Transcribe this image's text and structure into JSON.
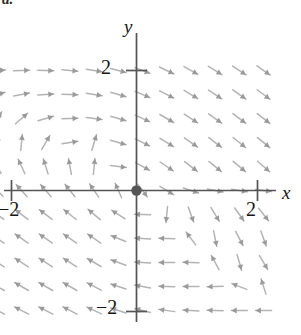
{
  "figure": {
    "caption": "a.",
    "background_color": "#ffffff"
  },
  "axes": {
    "x_label": "x",
    "y_label": "y",
    "axis_color": "#555555",
    "origin_dot_color": "#555555",
    "ticks": {
      "x_positive": "2",
      "x_negative": "−2",
      "y_positive": "2",
      "y_negative": "−2"
    }
  },
  "chart_data": {
    "type": "scatter",
    "subtype": "vector-field",
    "title": "",
    "xlabel": "x",
    "ylabel": "y",
    "xlim": [
      -2.6,
      2.6
    ],
    "ylim": [
      -2.6,
      2.6
    ],
    "xticks": [
      -2,
      2
    ],
    "yticks": [
      -2,
      2
    ],
    "xticklabels": [
      "−2",
      "2"
    ],
    "yticklabels": [
      "−2",
      "2"
    ],
    "grid": false,
    "legend": null,
    "arrow_color": "#b3b3b3",
    "arrowhead_color": "#9a9a9a",
    "grid_spacing": 0.4,
    "arrow_length_px": 16,
    "spiral_center": [
      1.0,
      -0.8
    ],
    "vectors": [
      {
        "x": -2.3,
        "y": 2.0,
        "u": 1.0,
        "v": 0.06
      },
      {
        "x": -1.9,
        "y": 2.0,
        "u": 1.0,
        "v": 0.02
      },
      {
        "x": -1.5,
        "y": 2.0,
        "u": 1.0,
        "v": -0.02
      },
      {
        "x": -1.1,
        "y": 2.0,
        "u": 1.0,
        "v": -0.08
      },
      {
        "x": -0.7,
        "y": 2.0,
        "u": 1.0,
        "v": -0.16
      },
      {
        "x": -0.3,
        "y": 2.0,
        "u": 1.0,
        "v": -0.26
      },
      {
        "x": 0.1,
        "y": 2.0,
        "u": 1.0,
        "v": -0.38
      },
      {
        "x": 0.5,
        "y": 2.0,
        "u": 1.0,
        "v": -0.48
      },
      {
        "x": 0.9,
        "y": 2.0,
        "u": 1.0,
        "v": -0.56
      },
      {
        "x": 1.3,
        "y": 2.0,
        "u": 1.0,
        "v": -0.62
      },
      {
        "x": 1.7,
        "y": 2.0,
        "u": 1.0,
        "v": -0.66
      },
      {
        "x": 2.1,
        "y": 2.0,
        "u": 1.0,
        "v": -0.7
      },
      {
        "x": -2.3,
        "y": 1.6,
        "u": 1.0,
        "v": 0.3
      },
      {
        "x": -1.9,
        "y": 1.6,
        "u": 1.0,
        "v": 0.18
      },
      {
        "x": -1.5,
        "y": 1.6,
        "u": 1.0,
        "v": 0.06
      },
      {
        "x": -1.1,
        "y": 1.6,
        "u": 1.0,
        "v": -0.04
      },
      {
        "x": -0.7,
        "y": 1.6,
        "u": 1.0,
        "v": -0.16
      },
      {
        "x": -0.3,
        "y": 1.6,
        "u": 1.0,
        "v": -0.3
      },
      {
        "x": 0.1,
        "y": 1.6,
        "u": 1.0,
        "v": -0.42
      },
      {
        "x": 0.5,
        "y": 1.6,
        "u": 1.0,
        "v": -0.52
      },
      {
        "x": 0.9,
        "y": 1.6,
        "u": 1.0,
        "v": -0.6
      },
      {
        "x": 1.3,
        "y": 1.6,
        "u": 1.0,
        "v": -0.66
      },
      {
        "x": 1.7,
        "y": 1.6,
        "u": 1.0,
        "v": -0.7
      },
      {
        "x": 2.1,
        "y": 1.6,
        "u": 1.0,
        "v": -0.74
      },
      {
        "x": -2.3,
        "y": 1.2,
        "u": 0.55,
        "v": 0.84
      },
      {
        "x": -1.9,
        "y": 1.2,
        "u": 0.75,
        "v": 0.66
      },
      {
        "x": -1.5,
        "y": 1.2,
        "u": 1.0,
        "v": 0.28
      },
      {
        "x": -1.1,
        "y": 1.2,
        "u": 1.0,
        "v": 0.04
      },
      {
        "x": -0.7,
        "y": 1.2,
        "u": 1.0,
        "v": -0.12
      },
      {
        "x": -0.3,
        "y": 1.2,
        "u": 1.0,
        "v": -0.3
      },
      {
        "x": 0.1,
        "y": 1.2,
        "u": 1.0,
        "v": -0.46
      },
      {
        "x": 0.5,
        "y": 1.2,
        "u": 1.0,
        "v": -0.58
      },
      {
        "x": 0.9,
        "y": 1.2,
        "u": 1.0,
        "v": -0.66
      },
      {
        "x": 1.3,
        "y": 1.2,
        "u": 1.0,
        "v": -0.72
      },
      {
        "x": 1.7,
        "y": 1.2,
        "u": 1.0,
        "v": -0.76
      },
      {
        "x": 2.1,
        "y": 1.2,
        "u": 1.0,
        "v": -0.78
      },
      {
        "x": -2.3,
        "y": 0.8,
        "u": 0.18,
        "v": 1.0
      },
      {
        "x": -1.9,
        "y": 0.8,
        "u": 0.1,
        "v": 1.0
      },
      {
        "x": -1.5,
        "y": 0.8,
        "u": 0.52,
        "v": 0.88
      },
      {
        "x": -1.1,
        "y": 0.8,
        "u": 1.0,
        "v": 0.16
      },
      {
        "x": -0.7,
        "y": 0.8,
        "u": 0.3,
        "v": 1.0
      },
      {
        "x": -0.3,
        "y": 0.8,
        "u": 1.0,
        "v": -0.28
      },
      {
        "x": 0.1,
        "y": 0.8,
        "u": 1.0,
        "v": -0.5
      },
      {
        "x": 0.5,
        "y": 0.8,
        "u": 1.0,
        "v": -0.62
      },
      {
        "x": 0.9,
        "y": 0.8,
        "u": 1.0,
        "v": -0.7
      },
      {
        "x": 1.3,
        "y": 0.8,
        "u": 1.0,
        "v": -0.76
      },
      {
        "x": 1.7,
        "y": 0.8,
        "u": 1.0,
        "v": -0.8
      },
      {
        "x": 2.1,
        "y": 0.8,
        "u": 1.0,
        "v": -0.82
      },
      {
        "x": -2.3,
        "y": 0.4,
        "u": -0.48,
        "v": 0.88
      },
      {
        "x": -1.9,
        "y": 0.4,
        "u": -0.42,
        "v": 0.9
      },
      {
        "x": -1.5,
        "y": 0.4,
        "u": -0.3,
        "v": 0.95
      },
      {
        "x": -1.1,
        "y": 0.4,
        "u": -0.18,
        "v": 0.98
      },
      {
        "x": -0.7,
        "y": 0.4,
        "u": 0.1,
        "v": 1.0
      },
      {
        "x": -0.3,
        "y": 0.4,
        "u": 1.0,
        "v": -0.12
      },
      {
        "x": 0.1,
        "y": 0.4,
        "u": 1.0,
        "v": -0.55
      },
      {
        "x": 0.5,
        "y": 0.4,
        "u": 1.0,
        "v": -0.68
      },
      {
        "x": 0.9,
        "y": 0.4,
        "u": 1.0,
        "v": -0.76
      },
      {
        "x": 1.3,
        "y": 0.4,
        "u": 1.0,
        "v": -0.82
      },
      {
        "x": 1.7,
        "y": 0.4,
        "u": 1.0,
        "v": -0.84
      },
      {
        "x": 2.1,
        "y": 0.4,
        "u": 1.0,
        "v": -0.86
      },
      {
        "x": -2.3,
        "y": 0.0,
        "u": -0.7,
        "v": 0.72
      },
      {
        "x": -1.9,
        "y": 0.0,
        "u": -0.68,
        "v": 0.74
      },
      {
        "x": -1.5,
        "y": 0.0,
        "u": -0.66,
        "v": 0.76
      },
      {
        "x": -1.1,
        "y": 0.0,
        "u": -0.62,
        "v": 0.78
      },
      {
        "x": -0.7,
        "y": 0.0,
        "u": -0.56,
        "v": 0.82
      },
      {
        "x": -0.3,
        "y": 0.0,
        "u": -0.4,
        "v": 0.9
      },
      {
        "x": 0.1,
        "y": 0.0,
        "u": 0.6,
        "v": -0.8
      },
      {
        "x": 0.5,
        "y": 0.0,
        "u": 0.85,
        "v": -0.52
      },
      {
        "x": 0.9,
        "y": 0.0,
        "u": 0.95,
        "v": -0.32
      },
      {
        "x": 1.3,
        "y": 0.0,
        "u": 1.0,
        "v": -0.2
      },
      {
        "x": 1.7,
        "y": 0.0,
        "u": 1.0,
        "v": -0.16
      },
      {
        "x": 2.1,
        "y": 0.0,
        "u": 1.0,
        "v": -0.14
      },
      {
        "x": -2.3,
        "y": -0.4,
        "u": -0.8,
        "v": 0.6
      },
      {
        "x": -1.9,
        "y": -0.4,
        "u": -0.8,
        "v": 0.6
      },
      {
        "x": -1.5,
        "y": -0.4,
        "u": -0.8,
        "v": 0.6
      },
      {
        "x": -1.1,
        "y": -0.4,
        "u": -0.78,
        "v": 0.62
      },
      {
        "x": -0.7,
        "y": -0.4,
        "u": -0.76,
        "v": 0.64
      },
      {
        "x": -0.3,
        "y": -0.4,
        "u": -0.84,
        "v": 0.54
      },
      {
        "x": 0.1,
        "y": -0.4,
        "u": -1.0,
        "v": 0.04
      },
      {
        "x": 0.5,
        "y": -0.4,
        "u": -0.1,
        "v": -1.0
      },
      {
        "x": 0.9,
        "y": -0.4,
        "u": 0.34,
        "v": -0.94
      },
      {
        "x": 1.3,
        "y": -0.4,
        "u": 0.52,
        "v": -0.86
      },
      {
        "x": 1.7,
        "y": -0.4,
        "u": 0.58,
        "v": -0.82
      },
      {
        "x": 2.1,
        "y": -0.4,
        "u": 0.62,
        "v": -0.78
      },
      {
        "x": -2.3,
        "y": -0.8,
        "u": -0.82,
        "v": 0.56
      },
      {
        "x": -1.9,
        "y": -0.8,
        "u": -0.82,
        "v": 0.56
      },
      {
        "x": -1.5,
        "y": -0.8,
        "u": -0.82,
        "v": 0.56
      },
      {
        "x": -1.1,
        "y": -0.8,
        "u": -0.82,
        "v": 0.56
      },
      {
        "x": -0.7,
        "y": -0.8,
        "u": -0.82,
        "v": 0.56
      },
      {
        "x": -0.3,
        "y": -0.8,
        "u": -0.92,
        "v": 0.38
      },
      {
        "x": 0.1,
        "y": -0.8,
        "u": -1.0,
        "v": 0.06
      },
      {
        "x": 0.5,
        "y": -0.8,
        "u": -1.0,
        "v": 0.02
      },
      {
        "x": 0.9,
        "y": -0.8,
        "u": -0.6,
        "v": 0.8
      },
      {
        "x": 1.3,
        "y": -0.8,
        "u": 0.2,
        "v": -0.98
      },
      {
        "x": 1.7,
        "y": -0.8,
        "u": 0.46,
        "v": -0.88
      },
      {
        "x": 2.1,
        "y": -0.8,
        "u": 0.34,
        "v": -0.94
      },
      {
        "x": -2.3,
        "y": -1.2,
        "u": -0.84,
        "v": 0.54
      },
      {
        "x": -1.9,
        "y": -1.2,
        "u": -0.84,
        "v": 0.54
      },
      {
        "x": -1.5,
        "y": -1.2,
        "u": -0.84,
        "v": 0.54
      },
      {
        "x": -1.1,
        "y": -1.2,
        "u": -0.84,
        "v": 0.54
      },
      {
        "x": -0.7,
        "y": -1.2,
        "u": -0.86,
        "v": 0.5
      },
      {
        "x": -0.3,
        "y": -1.2,
        "u": -0.94,
        "v": 0.34
      },
      {
        "x": 0.1,
        "y": -1.2,
        "u": -1.0,
        "v": 0.06
      },
      {
        "x": 0.5,
        "y": -1.2,
        "u": -1.0,
        "v": 0.0
      },
      {
        "x": 0.9,
        "y": -1.2,
        "u": -1.0,
        "v": 0.02
      },
      {
        "x": 1.3,
        "y": -1.2,
        "u": -0.48,
        "v": 0.88
      },
      {
        "x": 1.7,
        "y": -1.2,
        "u": 0.28,
        "v": -0.96
      },
      {
        "x": 2.1,
        "y": -1.2,
        "u": 0.52,
        "v": -0.86
      },
      {
        "x": -2.3,
        "y": -1.6,
        "u": -0.86,
        "v": 0.5
      },
      {
        "x": -1.9,
        "y": -1.6,
        "u": -0.86,
        "v": 0.5
      },
      {
        "x": -1.5,
        "y": -1.6,
        "u": -0.86,
        "v": 0.5
      },
      {
        "x": -1.1,
        "y": -1.6,
        "u": -0.86,
        "v": 0.5
      },
      {
        "x": -0.7,
        "y": -1.6,
        "u": -0.88,
        "v": 0.46
      },
      {
        "x": -0.3,
        "y": -1.6,
        "u": -0.94,
        "v": 0.32
      },
      {
        "x": 0.1,
        "y": -1.6,
        "u": -0.98,
        "v": 0.18
      },
      {
        "x": 0.5,
        "y": -1.6,
        "u": -1.0,
        "v": 0.04
      },
      {
        "x": 0.9,
        "y": -1.6,
        "u": -1.0,
        "v": 0.0
      },
      {
        "x": 1.3,
        "y": -1.6,
        "u": -1.0,
        "v": -0.02
      },
      {
        "x": 1.7,
        "y": -1.6,
        "u": -0.92,
        "v": 0.36
      },
      {
        "x": 2.1,
        "y": -1.6,
        "u": -0.3,
        "v": 0.94
      },
      {
        "x": -2.3,
        "y": -2.0,
        "u": -0.88,
        "v": 0.46
      },
      {
        "x": -1.9,
        "y": -2.0,
        "u": -0.88,
        "v": 0.46
      },
      {
        "x": -1.5,
        "y": -2.0,
        "u": -0.88,
        "v": 0.46
      },
      {
        "x": -1.1,
        "y": -2.0,
        "u": -0.88,
        "v": 0.46
      },
      {
        "x": -0.7,
        "y": -2.0,
        "u": -0.9,
        "v": 0.42
      },
      {
        "x": -0.3,
        "y": -2.0,
        "u": -0.94,
        "v": 0.3
      },
      {
        "x": 0.1,
        "y": -2.0,
        "u": -0.96,
        "v": 0.24
      },
      {
        "x": 0.5,
        "y": -2.0,
        "u": -0.98,
        "v": 0.14
      },
      {
        "x": 0.9,
        "y": -2.0,
        "u": -1.0,
        "v": 0.06
      },
      {
        "x": 1.3,
        "y": -2.0,
        "u": -1.0,
        "v": 0.02
      },
      {
        "x": 1.7,
        "y": -2.0,
        "u": -1.0,
        "v": 0.0
      },
      {
        "x": 2.1,
        "y": -2.0,
        "u": -1.0,
        "v": 0.0
      }
    ]
  }
}
